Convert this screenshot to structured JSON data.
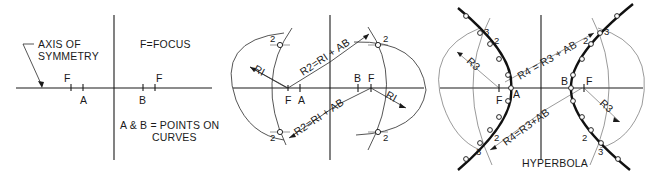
{
  "figure": {
    "colors": {
      "ink": "#1a1a1a",
      "background": "#ffffff"
    }
  },
  "panel1": {
    "axis_label_line1": "AXIS OF",
    "axis_label_line2": "SYMMETRY",
    "focus_legend": "F=FOCUS",
    "points_legend_line1": "A & B = POINTS ON",
    "points_legend_line2": "CURVES",
    "focus_left": "F",
    "focus_right": "F",
    "point_a": "A",
    "point_b": "B"
  },
  "panel2": {
    "focus_left": "F",
    "point_a": "A",
    "point_b": "B",
    "focus_right": "F",
    "radius_left": "RI",
    "radius_right": "RI",
    "upper_formula": "R2=RI + AB",
    "lower_formula": "R2=RI + AB",
    "mark_tl": "2",
    "mark_bl": "2",
    "mark_tr": "2",
    "mark_br": "2"
  },
  "panel3": {
    "title": "HYPERBOLA",
    "focus_left": "F",
    "point_a": "A",
    "point_b": "B",
    "focus_right": "F",
    "radius_left": "R3",
    "radius_right": "R3",
    "upper_formula": "R4 = R3 + AB",
    "lower_formula": "R4=R3+AB",
    "mark3_tl": "3",
    "mark2_tl": "2",
    "mark3_bl": "3",
    "mark2_bl": "2",
    "mark3_tr": "3",
    "mark2_tr": "2",
    "mark3_br": "3",
    "mark2_br": "2"
  }
}
